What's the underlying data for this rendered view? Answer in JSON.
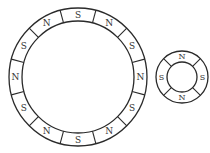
{
  "diagram": {
    "type": "magnet-rings",
    "large_ring": {
      "center": [
        78,
        77
      ],
      "outer_radius": 69,
      "inner_radius": 56,
      "segment_count": 12,
      "start_angle_deg": 0,
      "poles": [
        "S",
        "N",
        "S",
        "N",
        "S",
        "N",
        "S",
        "N",
        "S",
        "N",
        "S",
        "N"
      ]
    },
    "small_ring": {
      "center": [
        182,
        77
      ],
      "outer_radius": 26,
      "inner_radius": 15,
      "segment_count": 4,
      "start_angle_deg": 0,
      "poles": [
        "N",
        "S",
        "N",
        "S"
      ]
    },
    "stroke_color": "#2a2a2a",
    "label_color": "#333333"
  }
}
